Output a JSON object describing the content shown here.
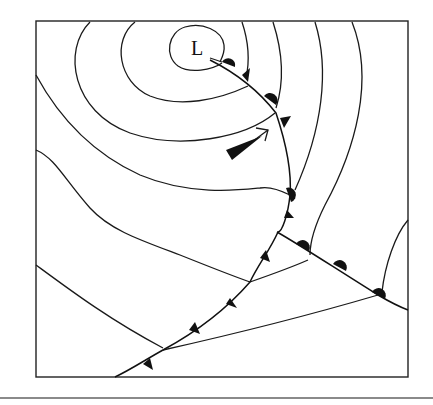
{
  "diagram": {
    "type": "synoptic-weather-map",
    "low_pressure_label": "L",
    "elements": [
      "isobars",
      "low-pressure-center",
      "warm-front",
      "cold-front",
      "occluded-front",
      "wind-direction-arrow",
      "airflow-wedge-arrow"
    ],
    "colors": {
      "line": "#111111",
      "background": "#ffffff",
      "bottom_rule": "#8a8a8a"
    }
  }
}
